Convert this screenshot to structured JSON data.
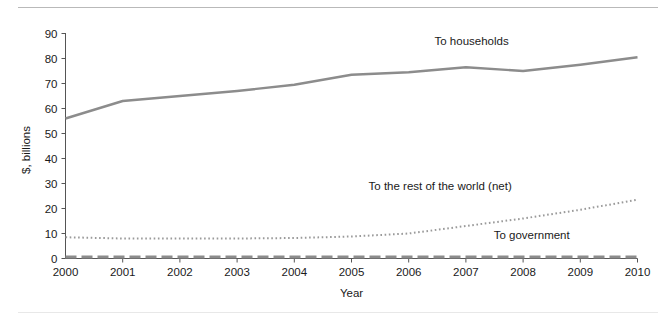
{
  "chart_data": {
    "type": "line",
    "title": "",
    "xlabel": "Year",
    "ylabel": "$, billions",
    "x": [
      2000,
      2001,
      2002,
      2003,
      2004,
      2005,
      2006,
      2007,
      2008,
      2009,
      2010
    ],
    "xlim": [
      2000,
      2010
    ],
    "ylim": [
      0,
      90
    ],
    "yticks": [
      0,
      10,
      20,
      30,
      40,
      50,
      60,
      70,
      80,
      90
    ],
    "xticks": [
      "2000",
      "2001",
      "2002",
      "2003",
      "2004",
      "2005",
      "2006",
      "2007",
      "2008",
      "2009",
      "2010"
    ],
    "grid": false,
    "legend_position": "inline-annotations",
    "series": [
      {
        "name": "To households",
        "style": "solid",
        "color": "#8c8c8c",
        "values": [
          56.0,
          63.0,
          65.0,
          67.0,
          69.5,
          73.5,
          74.5,
          76.5,
          75.0,
          77.5,
          80.5
        ],
        "label_text": "To households",
        "label_x": 2007.1,
        "label_y": 85.5
      },
      {
        "name": "To the rest of the world (net)",
        "style": "dotted",
        "color": "#9a9a9a",
        "values": [
          8.5,
          8.0,
          8.0,
          8.0,
          8.2,
          8.8,
          10.0,
          13.0,
          16.0,
          19.5,
          23.5
        ],
        "label_text": "To the rest of the world (net)",
        "label_x": 2006.55,
        "label_y": 27.5
      },
      {
        "name": "To government",
        "style": "dashed",
        "color": "#8c8c8c",
        "values": [
          0.6,
          0.6,
          0.6,
          0.6,
          0.6,
          0.6,
          0.6,
          0.6,
          0.6,
          0.6,
          0.6
        ],
        "label_text": "To government",
        "label_x": 2008.15,
        "label_y": 8.0
      }
    ]
  },
  "axes": {
    "y_axis_title": "$, billions",
    "x_axis_title": "Year"
  }
}
